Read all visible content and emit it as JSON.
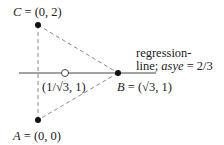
{
  "diagram": {
    "points": {
      "C": {
        "name": "C",
        "label_rest": " = (0, 2)"
      },
      "A": {
        "name": "A",
        "label_rest": " = (0, 0)"
      },
      "B": {
        "name": "B",
        "label_rest": " = (√3, 1)"
      },
      "M": {
        "label": "(1/√3, 1)"
      }
    },
    "regression_label": {
      "line1": "regression-",
      "line2_prefix": "line; ",
      "line2_italic": "asye",
      "line2_suffix": " = 2/3"
    },
    "colors": {
      "ink": "#222222",
      "dashes": "#888888",
      "solid_line": "#444444"
    }
  }
}
